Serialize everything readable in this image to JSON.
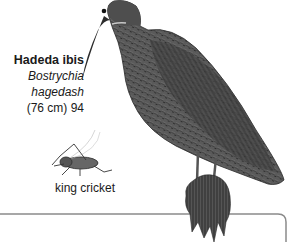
{
  "species": {
    "common_name": "Hadeda ibis",
    "scientific_name_line1": "Bostrychia",
    "scientific_name_line2": "hagedash",
    "size_and_number": "(76 cm) 94"
  },
  "prey": {
    "label": "king cricket"
  },
  "colors": {
    "background": "#ffffff",
    "text": "#1a1a1a",
    "frame_line": "#8a8a8a",
    "plumage_dark": "#3a3a3a",
    "plumage_mid": "#6a6a6a"
  }
}
